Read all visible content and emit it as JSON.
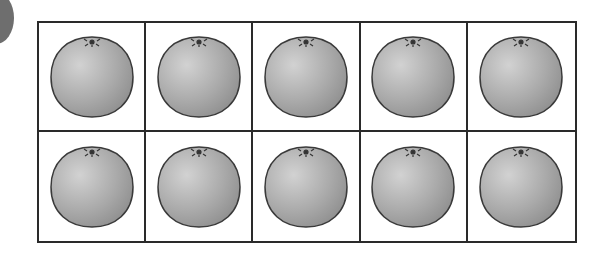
{
  "ten_frame": {
    "rows": 2,
    "columns": 5,
    "cells": [
      {
        "item": "orange"
      },
      {
        "item": "orange"
      },
      {
        "item": "orange"
      },
      {
        "item": "orange"
      },
      {
        "item": "orange"
      },
      {
        "item": "orange"
      },
      {
        "item": "orange"
      },
      {
        "item": "orange"
      },
      {
        "item": "orange"
      },
      {
        "item": "orange"
      }
    ],
    "count": 10
  },
  "colors": {
    "grid_line": "#2a2a2a",
    "fruit_fill": "#a9a9a9",
    "fruit_outline": "#3a3a3a"
  }
}
